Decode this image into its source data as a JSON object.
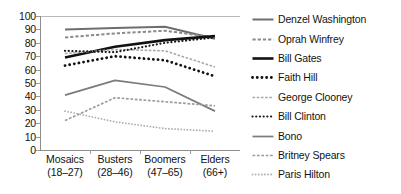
{
  "chart_data": {
    "type": "line",
    "title": "",
    "xlabel": "",
    "ylabel": "",
    "ylim": [
      0,
      100
    ],
    "yticks": [
      0,
      10,
      20,
      30,
      40,
      50,
      60,
      70,
      80,
      90,
      100
    ],
    "grid": false,
    "legend_position": "right",
    "categories": [
      "Mosaics",
      "Busters",
      "Boomers",
      "Elders"
    ],
    "category_sublabels": [
      "(18–27)",
      "(28–46)",
      "(47–65)",
      "(66+)"
    ],
    "series": [
      {
        "name": "Denzel Washington",
        "values": [
          90,
          91,
          92,
          83
        ],
        "style": "solid",
        "color": "#6e6e6e",
        "width": 2.0
      },
      {
        "name": "Oprah Winfrey",
        "values": [
          84,
          87,
          89,
          84
        ],
        "style": "dashed",
        "color": "#8a8a8a",
        "width": 2.0
      },
      {
        "name": "Bill Gates",
        "values": [
          69,
          77,
          82,
          85
        ],
        "style": "solid",
        "color": "#111111",
        "width": 2.6
      },
      {
        "name": "Faith Hill",
        "values": [
          63,
          70,
          67,
          55
        ],
        "style": "dotted",
        "color": "#111111",
        "width": 2.8
      },
      {
        "name": "George Clooney",
        "values": [
          72,
          75,
          74,
          62
        ],
        "style": "dashed",
        "color": "#a8a8a8",
        "width": 1.6
      },
      {
        "name": "Bill Clinton",
        "values": [
          74,
          73,
          80,
          84
        ],
        "style": "dotted",
        "color": "#1a1a1a",
        "width": 2.2
      },
      {
        "name": "Bono",
        "values": [
          41,
          52,
          47,
          29
        ],
        "style": "solid",
        "color": "#7b7b7b",
        "width": 1.7
      },
      {
        "name": "Britney Spears",
        "values": [
          22,
          39,
          36,
          33
        ],
        "style": "dashed",
        "color": "#9b9b9b",
        "width": 1.7
      },
      {
        "name": "Paris Hilton",
        "values": [
          29,
          21,
          16,
          14
        ],
        "style": "dotted",
        "color": "#b0b0b0",
        "width": 1.8
      }
    ]
  },
  "legend": {
    "items": [
      {
        "label": "Denzel Washington"
      },
      {
        "label": "Oprah Winfrey"
      },
      {
        "label": "Bill Gates"
      },
      {
        "label": "Faith Hill"
      },
      {
        "label": "George Clooney"
      },
      {
        "label": "Bill Clinton"
      },
      {
        "label": "Bono"
      },
      {
        "label": "Britney Spears"
      },
      {
        "label": "Paris Hilton"
      }
    ]
  },
  "axis": {
    "y_labels": [
      "100",
      "90",
      "80",
      "70",
      "60",
      "50",
      "40",
      "30",
      "20",
      "10",
      "0"
    ]
  }
}
